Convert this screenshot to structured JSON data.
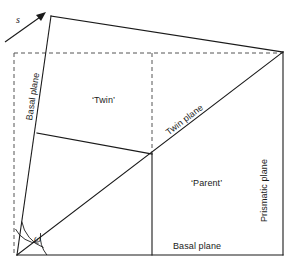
{
  "figure": {
    "background_color": "#ffffff",
    "line_color": "#1a1a1a",
    "dashed_color": "#555555",
    "width": 296,
    "height": 268
  },
  "labels": {
    "shear_vector": "s",
    "basal_plane_left": "Basal plane",
    "basal_plane_bottom": "Basal plane",
    "prismatic_plane": "Prismatic plane",
    "twin_plane": "Twin plane",
    "twin_region": "‘Twin’",
    "parent_region": "‘Parent’",
    "omega_angle": "ω"
  },
  "geometry": {
    "description": "Sheared parallelogram cell showing a twinned region above a twin plane and an untwinned parent region below it.",
    "vertices": {
      "bottom_left": [
        17,
        255
      ],
      "bottom_right": [
        283,
        255
      ],
      "top_right": [
        283,
        52
      ],
      "top_left_sheared": [
        51,
        16
      ],
      "junction_center": [
        152,
        154
      ],
      "left_kink": [
        37,
        133
      ]
    },
    "dashed_frame": {
      "vertical_x": 14,
      "vertical_from_y": 53,
      "vertical_to_y": 255,
      "horizontal_y": 53,
      "horizontal_from_x": 14,
      "horizontal_to_x": 283,
      "inner_vertical_x": 152,
      "inner_vertical_from_y": 53,
      "inner_vertical_to_y": 154
    },
    "shear_arrow": {
      "from": [
        5,
        42
      ],
      "to": [
        46,
        13
      ]
    },
    "omega_arcs": [
      {
        "radius": 26,
        "note": "arc between vertical dashed edge and sheared basal line"
      },
      {
        "radius": 34,
        "note": "arc between sheared basal line and twin plane diagonal"
      },
      {
        "radius": 30,
        "note": "arc between twin plane diagonal and bottom basal line"
      }
    ]
  }
}
